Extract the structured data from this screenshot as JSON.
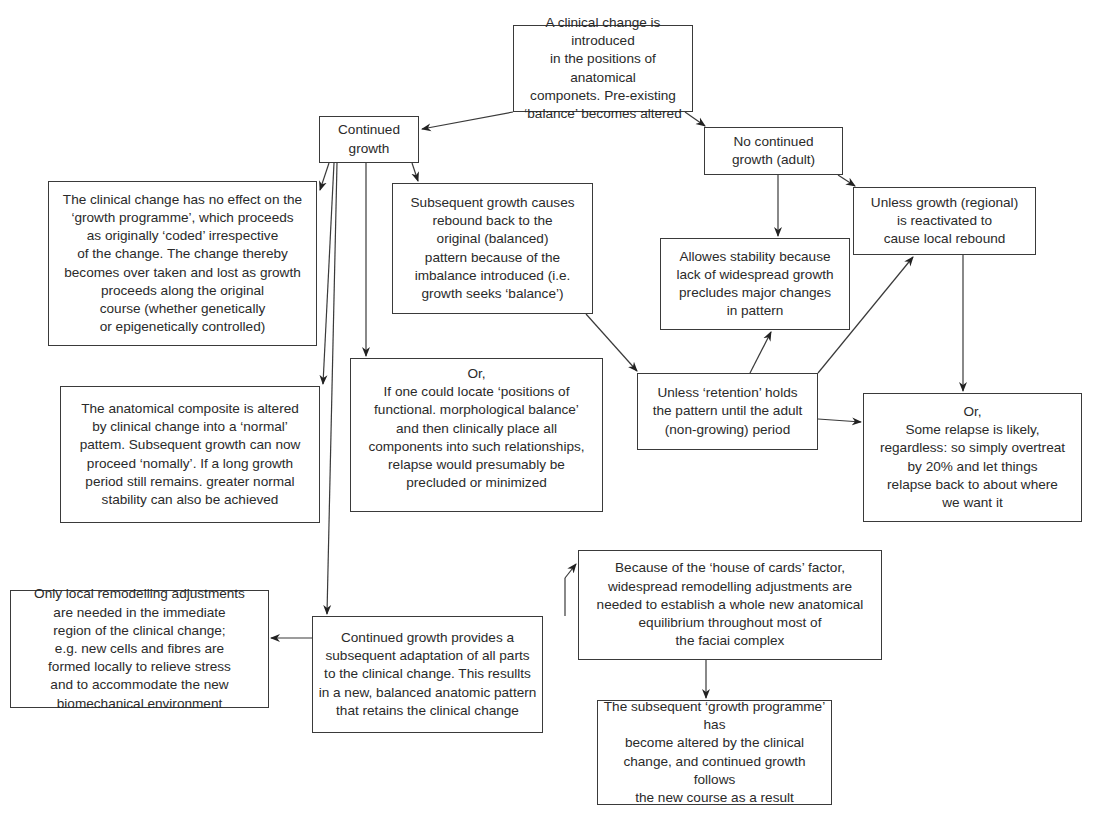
{
  "diagram": {
    "type": "flowchart",
    "nodes": [
      {
        "id": "n_start",
        "text": "A clinical change is introduced\nin the positions of anatomical\ncomponets. Pre-existing\n‘balance’ becomes altered"
      },
      {
        "id": "n_continued",
        "text": "Continued\ngrowth"
      },
      {
        "id": "n_no_continued",
        "text": "No continued\ngrowth (adult)"
      },
      {
        "id": "n_no_effect",
        "text": "The clinical change has no effect on the\n‘growth programme’, which proceeds\nas originally ‘coded’ irrespective\nof the change. The change thereby\nbecomes over taken and lost as growth\nproceeds along the original\ncourse (whether genetically\nor epigenetically controlled)"
      },
      {
        "id": "n_rebound",
        "text": "Subsequent growth causes\nrebound back to the\noriginal (balanced)\npattern because of the\nimbalance introduced (i.e.\ngrowth seeks ‘balance’)"
      },
      {
        "id": "n_unless_growth",
        "text": "Unless growth (regional)\nis reactivated to\ncause local rebound"
      },
      {
        "id": "n_allowes",
        "text": "Allowes stability because\nlack of widespread growth\nprecludes major changes\nin pattern"
      },
      {
        "id": "n_or_positions",
        "text": "Or,\nIf one could locate ‘positions of\nfunctional. morphological balance’\nand then clinically place all\ncomponents into such relationships,\nrelapse would presumably be\nprecluded or minimized"
      },
      {
        "id": "n_unless_retention",
        "text": "Unless ‘retention’ holds\nthe pattern until the adult\n(non-growing) period"
      },
      {
        "id": "n_composite",
        "text": "The anatomical composite is altered\nby clinical change into a ‘normal’\npattem. Subsequent growth can now\nproceed ‘nomally’. If a long growth\nperiod still remains. greater normal\nstability can also be achieved"
      },
      {
        "id": "n_or_relapse",
        "text": "Or,\nSome relapse is likely,\nregardless: so simply overtreat\nby 20% and let things\nrelapse back to about where\nwe want it"
      },
      {
        "id": "n_local",
        "text": "Only local remodelling adjustments\nare needed in the immediate\nregion of the clinical change;\ne.g. new cells and fibres are\nformed locally to relieve stress\nand to accommodate the new\nbiomechanical environment"
      },
      {
        "id": "n_adaptation",
        "text": "Continued growth provides a\nsubsequent adaptation of all parts\nto the clinical change. This resullts\nin a new, balanced anatomic pattern\nthat retains the clinical change"
      },
      {
        "id": "n_house_cards",
        "text": "Because of the ‘house of cards’ factor,\nwidespread remodelling adjustments are\nneeded to establish a whole new anatomical\nequilibrium throughout most of\nthe faciai complex"
      },
      {
        "id": "n_programme",
        "text": "The subsequent ‘growth programme’ has\nbecome altered by the clinical\nchange, and continued growth\nfollows\nthe new course as a result"
      }
    ],
    "edges": [
      {
        "from": "n_start",
        "to": "n_continued"
      },
      {
        "from": "n_start",
        "to": "n_no_continued"
      },
      {
        "from": "n_continued",
        "to": "n_no_effect"
      },
      {
        "from": "n_continued",
        "to": "n_composite"
      },
      {
        "from": "n_continued",
        "to": "n_adaptation"
      },
      {
        "from": "n_continued",
        "to": "n_or_positions"
      },
      {
        "from": "n_continued",
        "to": "n_rebound"
      },
      {
        "from": "n_rebound",
        "to": "n_unless_retention"
      },
      {
        "from": "n_no_continued",
        "to": "n_allowes"
      },
      {
        "from": "n_no_continued",
        "to": "n_unless_growth"
      },
      {
        "from": "n_unless_retention",
        "to": "n_allowes"
      },
      {
        "from": "n_unless_retention",
        "to": "n_unless_growth"
      },
      {
        "from": "n_unless_retention",
        "to": "n_or_relapse"
      },
      {
        "from": "n_unless_growth",
        "to": "n_or_relapse"
      },
      {
        "from": "n_adaptation",
        "to": "n_local"
      },
      {
        "from": "n_adaptation",
        "to": "n_house_cards"
      },
      {
        "from": "n_house_cards",
        "to": "n_programme"
      }
    ],
    "colors": {
      "line": "#3a3a3a",
      "background": "#ffffff",
      "text": "#2a2a2a"
    }
  }
}
